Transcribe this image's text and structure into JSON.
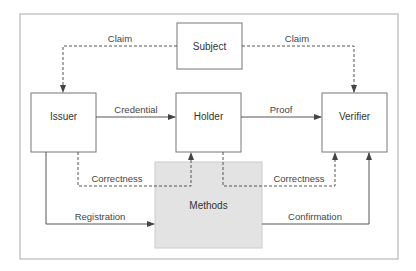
{
  "diagram": {
    "nodes": {
      "subject": {
        "label": "Subject"
      },
      "issuer": {
        "label": "Issuer"
      },
      "holder": {
        "label": "Holder"
      },
      "verifier": {
        "label": "Verifier"
      },
      "methods": {
        "label": "Methods"
      }
    },
    "edges": {
      "claim_issuer": {
        "label": "Claim",
        "from": "Subject",
        "to": "Issuer",
        "style": "dashed"
      },
      "claim_verifier": {
        "label": "Claim",
        "from": "Subject",
        "to": "Verifier",
        "style": "dashed"
      },
      "credential": {
        "label": "Credential",
        "from": "Issuer",
        "to": "Holder",
        "style": "solid"
      },
      "proof": {
        "label": "Proof",
        "from": "Holder",
        "to": "Verifier",
        "style": "solid"
      },
      "correctness_holder": {
        "label": "Correctness",
        "from": "Issuer",
        "to": "Holder",
        "style": "dashed"
      },
      "correctness_verifier": {
        "label": "Correctness",
        "from": "Holder",
        "to": "Verifier",
        "style": "dashed"
      },
      "registration": {
        "label": "Registration",
        "from": "Issuer",
        "to": "Methods",
        "style": "solid"
      },
      "confirmation": {
        "label": "Confirmation",
        "from": "Methods",
        "to": "Verifier",
        "style": "solid"
      }
    },
    "colors": {
      "line": "#555555",
      "frame": "#aaaaaa",
      "methods_fill": "#e3e3e3",
      "box_border": "#777777"
    }
  }
}
